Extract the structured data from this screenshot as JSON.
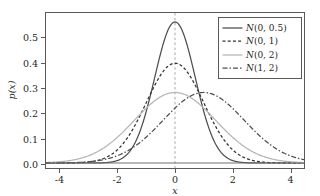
{
  "chart_data": {
    "type": "line",
    "title": "",
    "xlabel": "x",
    "ylabel": "p(x)",
    "xlim": [
      -4.5,
      4.5
    ],
    "ylim": [
      -0.02,
      0.6
    ],
    "xticks": [
      "-4",
      "-2",
      "0",
      "2",
      "4"
    ],
    "xtick_values": [
      -4,
      -2,
      0,
      2,
      4
    ],
    "yticks": [
      "0.0",
      "0.1",
      "0.2",
      "0.3",
      "0.4",
      "0.5"
    ],
    "ytick_values": [
      0.0,
      0.1,
      0.2,
      0.3,
      0.4,
      0.5
    ],
    "grid": false,
    "legend_position": "upper right",
    "annotations": [
      {
        "type": "vline",
        "x": 0,
        "style": "dashed",
        "color": "#9a9a9a"
      }
    ],
    "series": [
      {
        "name": "N(0, 0.5)",
        "mean": 0,
        "variance": 0.5,
        "peak": 0.564,
        "linestyle": "solid",
        "color": "#4d4d4d",
        "x": [
          -4.5,
          -4.0,
          -3.5,
          -3.0,
          -2.5,
          -2.0,
          -1.75,
          -1.5,
          -1.25,
          -1.0,
          -0.75,
          -0.5,
          -0.25,
          0.0,
          0.25,
          0.5,
          0.75,
          1.0,
          1.25,
          1.5,
          1.75,
          2.0,
          2.5,
          3.0,
          3.5,
          4.0,
          4.5
        ],
        "values": [
          0.0,
          0.0,
          0.003,
          0.013,
          0.044,
          0.104,
          0.147,
          0.194,
          0.239,
          0.276,
          0.3,
          0.307,
          0.297,
          0.282,
          0.297,
          0.307,
          0.3,
          0.276,
          0.239,
          0.194,
          0.147,
          0.104,
          0.044,
          0.013,
          0.003,
          0.0,
          0.0
        ]
      },
      {
        "name": "N(0, 1)",
        "mean": 0,
        "variance": 1,
        "peak": 0.399,
        "linestyle": "dotted",
        "color": "#333333",
        "x": [
          -4.5,
          -4.0,
          -3.5,
          -3.0,
          -2.5,
          -2.0,
          -1.5,
          -1.0,
          -0.5,
          0.0,
          0.5,
          1.0,
          1.5,
          2.0,
          2.5,
          3.0,
          3.5,
          4.0,
          4.5
        ],
        "values": [
          0.0,
          0.0,
          0.001,
          0.004,
          0.018,
          0.054,
          0.13,
          0.242,
          0.352,
          0.399,
          0.352,
          0.242,
          0.13,
          0.054,
          0.018,
          0.004,
          0.001,
          0.0,
          0.0
        ]
      },
      {
        "name": "N(0, 2)",
        "mean": 0,
        "variance": 2,
        "peak": 0.282,
        "linestyle": "solid",
        "color": "#b5b5b5",
        "x": [
          -4.5,
          -4.0,
          -3.5,
          -3.0,
          -2.5,
          -2.0,
          -1.5,
          -1.0,
          -0.5,
          0.0,
          0.5,
          1.0,
          1.5,
          2.0,
          2.5,
          3.0,
          3.5,
          4.0,
          4.5
        ],
        "values": [
          0.017,
          0.027,
          0.043,
          0.063,
          0.089,
          0.12,
          0.154,
          0.188,
          0.219,
          0.232,
          0.219,
          0.188,
          0.154,
          0.12,
          0.089,
          0.063,
          0.043,
          0.027,
          0.017
        ]
      },
      {
        "name": "N(1, 2)",
        "mean": 1,
        "variance": 2,
        "peak": 0.282,
        "linestyle": "dashdot",
        "color": "#4d4d4d",
        "x": [
          -4.5,
          -4.0,
          -3.5,
          -3.0,
          -2.5,
          -2.0,
          -1.5,
          -1.0,
          -0.5,
          0.0,
          0.5,
          1.0,
          1.5,
          2.0,
          2.5,
          3.0,
          3.5,
          4.0,
          4.5
        ],
        "values": [
          0.004,
          0.007,
          0.012,
          0.02,
          0.032,
          0.048,
          0.07,
          0.097,
          0.129,
          0.161,
          0.192,
          0.215,
          0.226,
          0.222,
          0.206,
          0.179,
          0.146,
          0.113,
          0.083
        ]
      }
    ]
  },
  "legend": {
    "entries": [
      {
        "label": "N(0, 0.5)"
      },
      {
        "label": "N(0, 1)"
      },
      {
        "label": "N(0, 2)"
      },
      {
        "label": "N(1, 2)"
      }
    ]
  },
  "axes": {
    "x_label": "x",
    "y_label": "p(x)",
    "xticks": [
      "-4",
      "-2",
      "0",
      "2",
      "4"
    ],
    "yticks": [
      "0.0",
      "0.1",
      "0.2",
      "0.3",
      "0.4",
      "0.5"
    ]
  },
  "colors": {
    "frame": "#5a5a5a",
    "text": "#262626",
    "background": "#ffffff"
  }
}
